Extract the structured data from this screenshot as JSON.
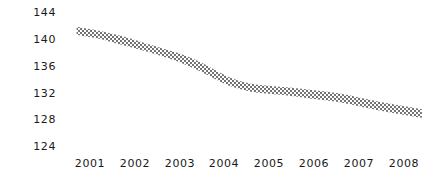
{
  "chart_data": {
    "type": "area",
    "title": "",
    "subtitle": "",
    "xlabel": "",
    "ylabel": "",
    "grid": false,
    "legend": null,
    "legend_position": "none",
    "band_style": "diagonal-hatch",
    "band_color": "#808080",
    "background_color": "#ffffff",
    "text_color": "#1a1a1a",
    "xlim": [
      2000.65,
      2008.45
    ],
    "ylim": [
      124,
      144
    ],
    "x_tick_labels": [
      "2001",
      "2002",
      "2003",
      "2004",
      "2005",
      "2006",
      "2007",
      "2008"
    ],
    "x_tick_values": [
      2001,
      2002,
      2003,
      2004,
      2005,
      2006,
      2007,
      2008
    ],
    "y_tick_labels": [
      "144",
      "140",
      "136",
      "132",
      "128",
      "124"
    ],
    "y_tick_values": [
      144,
      140,
      136,
      132,
      128,
      124
    ],
    "series": [
      {
        "name": "upper-bound",
        "values": [
          141.8,
          141.2,
          140.4,
          139.4,
          138.6,
          137.8,
          136.4,
          134.6,
          133.6,
          133.1,
          132.8,
          132.4,
          131.9,
          131.1,
          130.3,
          129.5
        ]
      },
      {
        "name": "lower-bound",
        "values": [
          140.6,
          140.0,
          139.1,
          138.2,
          137.4,
          136.5,
          135.0,
          133.3,
          132.4,
          131.9,
          131.6,
          131.1,
          130.6,
          129.8,
          129.0,
          128.2
        ]
      }
    ],
    "x": [
      2000.7,
      2001.2,
      2001.7,
      2002.2,
      2002.6,
      2003.0,
      2003.5,
      2004.0,
      2004.4,
      2004.8,
      2005.3,
      2005.9,
      2006.5,
      2007.1,
      2007.7,
      2008.4
    ],
    "annotations": []
  }
}
